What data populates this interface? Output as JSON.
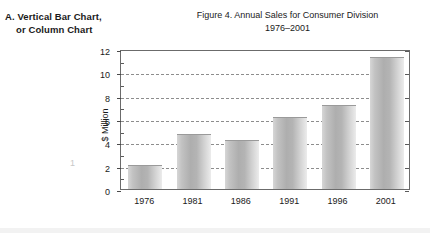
{
  "annotation": {
    "line1": "A.  Vertical Bar Chart,",
    "line2": "or Column Chart"
  },
  "page_marker": "1",
  "figure": {
    "title": "Figure 4.  Annual Sales for Consumer Division",
    "subtitle": "1976–2001"
  },
  "chart_data": {
    "type": "bar",
    "title": "Figure 4.  Annual Sales for Consumer Division",
    "subtitle": "1976–2001",
    "categories": [
      "1976",
      "1981",
      "1986",
      "1991",
      "1996",
      "2001"
    ],
    "values": [
      2.0,
      4.6,
      4.1,
      6.1,
      7.1,
      11.2
    ],
    "xlabel": "",
    "ylabel": "$ Million",
    "ylim": [
      0,
      12
    ],
    "ytick_labels": [
      "0",
      "2",
      "4",
      "6",
      "8",
      "10",
      "12"
    ],
    "ytick_values": [
      0,
      2,
      4,
      6,
      8,
      10,
      12
    ],
    "yminor_values": [
      1,
      3,
      5,
      7,
      9,
      11
    ],
    "gridlines": [
      2,
      4,
      6,
      8,
      10
    ],
    "grid": true,
    "legend": "none",
    "bar_color": "#b4b4b4",
    "axis_color": "#6b6b6b",
    "grid_color": "#8d8d8d"
  }
}
